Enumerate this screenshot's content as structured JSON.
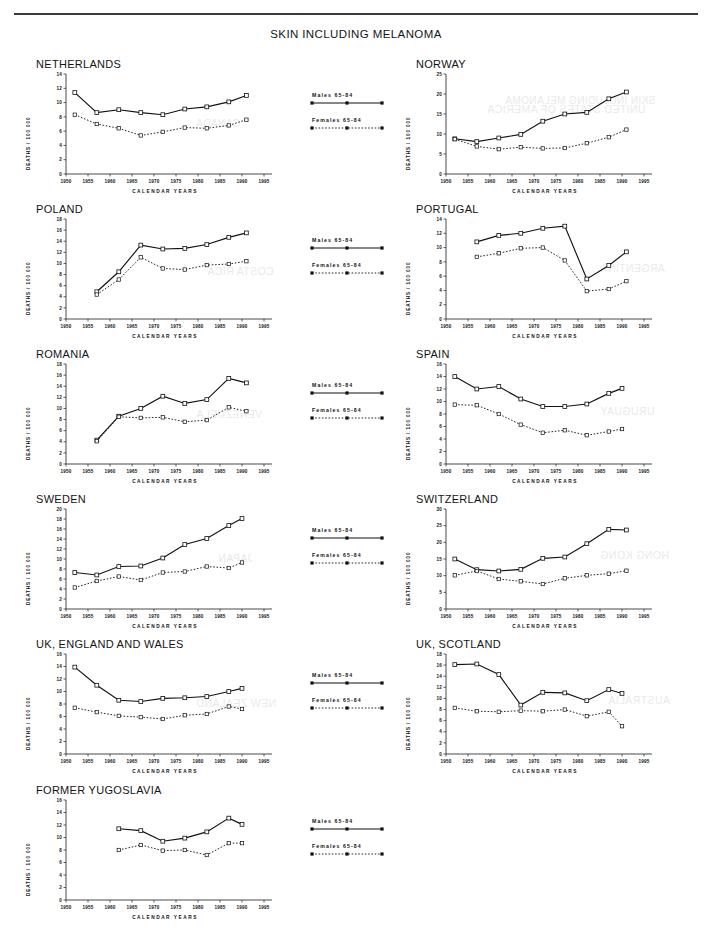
{
  "figure": {
    "title": "SKIN INCLUDING MELANOMA",
    "x_axis_label": "CALENDAR YEARS",
    "y_axis_label": "DEATHS / 100 000",
    "x_ticks": [
      1950,
      1955,
      1960,
      1965,
      1970,
      1975,
      1980,
      1985,
      1990,
      1995
    ],
    "xlim": [
      1950,
      1995
    ]
  },
  "legend": {
    "males_label": "Males  65-84",
    "females_label": "Females  65-84"
  },
  "chart_data": [
    {
      "type": "line",
      "title": "NETHERLANDS",
      "xlabel": "CALENDAR YEARS",
      "ylabel": "DEATHS / 100 000",
      "xlim": [
        1950,
        1995
      ],
      "ylim": [
        0,
        14
      ],
      "y_ticks": [
        0,
        2,
        4,
        6,
        8,
        10,
        12,
        14
      ],
      "grid": false,
      "legend_position": "center-column",
      "x": [
        1952,
        1957,
        1962,
        1967,
        1972,
        1977,
        1982,
        1987,
        1991
      ],
      "series": [
        {
          "name": "Males 65-84",
          "values": [
            11.4,
            8.6,
            9.0,
            8.6,
            8.3,
            9.1,
            9.4,
            10.1,
            11.0
          ]
        },
        {
          "name": "Females 65-84",
          "values": [
            8.3,
            7.0,
            6.4,
            5.4,
            5.9,
            6.5,
            6.4,
            6.8,
            7.6
          ]
        }
      ]
    },
    {
      "type": "line",
      "title": "NORWAY",
      "xlabel": "CALENDAR YEARS",
      "ylabel": "DEATHS / 100 000",
      "xlim": [
        1950,
        1995
      ],
      "ylim": [
        0,
        25
      ],
      "y_ticks": [
        0,
        5,
        10,
        15,
        20,
        25
      ],
      "grid": false,
      "legend_position": "center-column",
      "x": [
        1952,
        1957,
        1962,
        1967,
        1972,
        1977,
        1982,
        1987,
        1991
      ],
      "series": [
        {
          "name": "Males 65-84",
          "values": [
            8.8,
            8.1,
            9.0,
            9.9,
            13.2,
            15.0,
            15.4,
            18.8,
            20.5
          ]
        },
        {
          "name": "Females 65-84",
          "values": [
            8.7,
            6.9,
            6.2,
            6.7,
            6.4,
            6.5,
            7.7,
            9.2,
            11.1
          ]
        }
      ]
    },
    {
      "type": "line",
      "title": "POLAND",
      "xlabel": "CALENDAR YEARS",
      "ylabel": "DEATHS / 100 000",
      "xlim": [
        1950,
        1995
      ],
      "ylim": [
        0,
        18
      ],
      "y_ticks": [
        0,
        2,
        4,
        6,
        8,
        10,
        12,
        14,
        16,
        18
      ],
      "grid": false,
      "legend_position": "center-column",
      "x": [
        1957,
        1962,
        1967,
        1972,
        1977,
        1982,
        1987,
        1991
      ],
      "series": [
        {
          "name": "Males 65-84",
          "values": [
            4.9,
            8.5,
            13.3,
            12.6,
            12.7,
            13.4,
            14.7,
            15.5
          ]
        },
        {
          "name": "Females 65-84",
          "values": [
            4.4,
            7.1,
            11.1,
            9.1,
            8.9,
            9.7,
            9.9,
            10.4
          ]
        }
      ]
    },
    {
      "type": "line",
      "title": "PORTUGAL",
      "xlabel": "CALENDAR YEARS",
      "ylabel": "DEATHS / 100 000",
      "xlim": [
        1950,
        1995
      ],
      "ylim": [
        0,
        14
      ],
      "y_ticks": [
        0,
        2,
        4,
        6,
        8,
        10,
        12,
        14
      ],
      "grid": false,
      "legend_position": "center-column",
      "x": [
        1957,
        1962,
        1967,
        1972,
        1977,
        1982,
        1987,
        1991
      ],
      "series": [
        {
          "name": "Males 65-84",
          "values": [
            10.8,
            11.7,
            12.0,
            12.7,
            13.0,
            5.6,
            7.5,
            9.4
          ]
        },
        {
          "name": "Females 65-84",
          "values": [
            8.7,
            9.2,
            9.9,
            10.0,
            8.2,
            3.9,
            4.2,
            5.3
          ]
        }
      ]
    },
    {
      "type": "line",
      "title": "ROMANIA",
      "xlabel": "CALENDAR YEARS",
      "ylabel": "DEATHS / 100 000",
      "xlim": [
        1950,
        1995
      ],
      "ylim": [
        0,
        18
      ],
      "y_ticks": [
        0,
        2,
        4,
        6,
        8,
        10,
        12,
        14,
        16,
        18
      ],
      "grid": false,
      "legend_position": "center-column",
      "x": [
        1957,
        1962,
        1967,
        1972,
        1977,
        1982,
        1987,
        1991
      ],
      "series": [
        {
          "name": "Males 65-84",
          "values": [
            4.3,
            8.6,
            10.0,
            12.2,
            10.9,
            11.6,
            15.4,
            14.6
          ]
        },
        {
          "name": "Females 65-84",
          "values": [
            4.1,
            8.5,
            8.3,
            8.4,
            7.6,
            7.9,
            10.2,
            9.5
          ]
        }
      ]
    },
    {
      "type": "line",
      "title": "SPAIN",
      "xlabel": "CALENDAR YEARS",
      "ylabel": "DEATHS / 100 000",
      "xlim": [
        1950,
        1995
      ],
      "ylim": [
        0,
        16
      ],
      "y_ticks": [
        0,
        2,
        4,
        6,
        8,
        10,
        12,
        14,
        16
      ],
      "grid": false,
      "legend_position": "center-column",
      "x": [
        1952,
        1957,
        1962,
        1967,
        1972,
        1977,
        1982,
        1987,
        1990
      ],
      "series": [
        {
          "name": "Males 65-84",
          "values": [
            14.0,
            12.0,
            12.4,
            10.4,
            9.2,
            9.2,
            9.6,
            11.3,
            12.1
          ]
        },
        {
          "name": "Females 65-84",
          "values": [
            9.5,
            9.4,
            8.0,
            6.3,
            5.0,
            5.4,
            4.6,
            5.2,
            5.6
          ]
        }
      ]
    },
    {
      "type": "line",
      "title": "SWEDEN",
      "xlabel": "CALENDAR YEARS",
      "ylabel": "DEATHS / 100 000",
      "xlim": [
        1950,
        1995
      ],
      "ylim": [
        0,
        20
      ],
      "y_ticks": [
        0,
        2,
        4,
        6,
        8,
        10,
        12,
        14,
        16,
        18,
        20
      ],
      "grid": false,
      "legend_position": "center-column",
      "x": [
        1952,
        1957,
        1962,
        1967,
        1972,
        1977,
        1982,
        1987,
        1990
      ],
      "series": [
        {
          "name": "Males 65-84",
          "values": [
            7.3,
            6.8,
            8.5,
            8.6,
            10.2,
            12.9,
            14.1,
            16.7,
            18.1
          ]
        },
        {
          "name": "Females 65-84",
          "values": [
            4.3,
            5.6,
            6.5,
            5.8,
            7.3,
            7.5,
            8.5,
            8.2,
            9.3
          ]
        }
      ]
    },
    {
      "type": "line",
      "title": "SWITZERLAND",
      "xlabel": "CALENDAR YEARS",
      "ylabel": "DEATHS / 100 000",
      "xlim": [
        1950,
        1995
      ],
      "ylim": [
        0,
        30
      ],
      "y_ticks": [
        0,
        5,
        10,
        15,
        20,
        25,
        30
      ],
      "grid": false,
      "legend_position": "center-column",
      "x": [
        1952,
        1957,
        1962,
        1967,
        1972,
        1977,
        1982,
        1987,
        1991
      ],
      "series": [
        {
          "name": "Males 65-84",
          "values": [
            15.0,
            11.8,
            11.4,
            11.9,
            15.2,
            15.6,
            19.6,
            23.9,
            23.7
          ]
        },
        {
          "name": "Females 65-84",
          "values": [
            10.1,
            11.4,
            9.0,
            8.3,
            7.5,
            9.2,
            10.1,
            10.6,
            11.5
          ]
        }
      ]
    },
    {
      "type": "line",
      "title": "UK, ENGLAND AND WALES",
      "xlabel": "CALENDAR YEARS",
      "ylabel": "DEATHS / 100 000",
      "xlim": [
        1950,
        1995
      ],
      "ylim": [
        0,
        16
      ],
      "y_ticks": [
        0,
        2,
        4,
        6,
        8,
        10,
        12,
        14,
        16
      ],
      "grid": false,
      "legend_position": "center-column",
      "x": [
        1952,
        1957,
        1962,
        1967,
        1972,
        1977,
        1982,
        1987,
        1990
      ],
      "series": [
        {
          "name": "Males 65-84",
          "values": [
            13.9,
            11.0,
            8.6,
            8.4,
            8.9,
            9.0,
            9.2,
            10.0,
            10.5
          ]
        },
        {
          "name": "Females 65-84",
          "values": [
            7.4,
            6.7,
            6.1,
            5.9,
            5.6,
            6.2,
            6.4,
            7.6,
            7.2
          ]
        }
      ]
    },
    {
      "type": "line",
      "title": "UK, SCOTLAND",
      "xlabel": "CALENDAR YEARS",
      "ylabel": "DEATHS / 100 000",
      "xlim": [
        1950,
        1995
      ],
      "ylim": [
        0,
        18
      ],
      "y_ticks": [
        0,
        2,
        4,
        6,
        8,
        10,
        12,
        14,
        16,
        18
      ],
      "grid": false,
      "legend_position": "center-column",
      "x": [
        1952,
        1957,
        1962,
        1967,
        1972,
        1977,
        1982,
        1987,
        1990
      ],
      "series": [
        {
          "name": "Males 65-84",
          "values": [
            16.1,
            16.2,
            14.3,
            8.8,
            11.1,
            11.0,
            9.6,
            11.6,
            10.9
          ]
        },
        {
          "name": "Females 65-84",
          "values": [
            8.3,
            7.7,
            7.6,
            7.8,
            7.7,
            8.0,
            6.8,
            7.6,
            5.0
          ]
        }
      ]
    },
    {
      "type": "line",
      "title": "FORMER YUGOSLAVIA",
      "xlabel": "CALENDAR YEARS",
      "ylabel": "DEATHS / 100 000",
      "xlim": [
        1950,
        1995
      ],
      "ylim": [
        0,
        16
      ],
      "y_ticks": [
        0,
        2,
        4,
        6,
        8,
        10,
        12,
        14,
        16
      ],
      "grid": false,
      "legend_position": "center-column",
      "x": [
        1962,
        1967,
        1972,
        1977,
        1982,
        1987,
        1990
      ],
      "series": [
        {
          "name": "Males 65-84",
          "values": [
            11.4,
            11.1,
            9.4,
            9.9,
            10.9,
            13.1,
            12.1
          ]
        },
        {
          "name": "Females 65-84",
          "values": [
            8.0,
            8.8,
            7.9,
            8.0,
            7.2,
            9.1,
            9.1
          ]
        }
      ]
    }
  ],
  "ghost_text": [
    "SKIN INCLUDING MELANOMA",
    "CANADA",
    "UNITED STATES OF AMERICA",
    "COSTA RICA",
    "ARGENTINA",
    "VENEZUELA",
    "URUGUAY",
    "JAPAN",
    "HONG KONG",
    "NEW ZEALAND",
    "AUSTRALIA"
  ]
}
